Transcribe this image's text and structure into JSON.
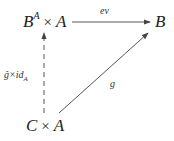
{
  "diagram": {
    "type": "commutative-diagram",
    "nodes": {
      "top_left": {
        "base": "B",
        "sup": "A",
        "times": "×",
        "right": "A"
      },
      "top_right": {
        "text": "B"
      },
      "bottom_left": {
        "left": "C",
        "times": "×",
        "right": "A"
      }
    },
    "edges": {
      "ev": {
        "label": "ev",
        "from": "B^A × A",
        "to": "B",
        "style": "solid"
      },
      "g": {
        "label": "g",
        "from": "C × A",
        "to": "B",
        "style": "solid"
      },
      "g_hat_id": {
        "label_main": "ĝ×id",
        "label_sub": "A",
        "from": "C × A",
        "to": "B^A × A",
        "style": "dashed"
      }
    },
    "colors": {
      "line": "#444444",
      "text": "#222222"
    }
  }
}
